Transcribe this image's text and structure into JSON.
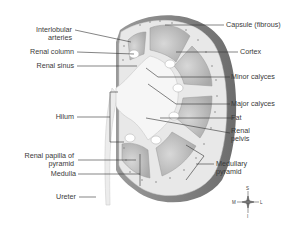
{
  "diagram": {
    "colors": {
      "capsule": "#7a7a7a",
      "cortex": "#e6e6e6",
      "pyramid": "#bdbdbd",
      "sinus": "#f4f4f4",
      "leader": "#333333",
      "text": "#3a3a3a"
    },
    "labels_left": [
      {
        "id": "interlobular-arteries",
        "lines": [
          "Interlobular",
          "arteries"
        ]
      },
      {
        "id": "renal-column",
        "lines": [
          "Renal column"
        ]
      },
      {
        "id": "renal-sinus",
        "lines": [
          "Renal sinus"
        ]
      },
      {
        "id": "hilum",
        "lines": [
          "Hilum"
        ]
      },
      {
        "id": "renal-papilla",
        "lines": [
          "Renal papilla of",
          "pyramid"
        ]
      },
      {
        "id": "medulla",
        "lines": [
          "Medulla"
        ]
      },
      {
        "id": "ureter",
        "lines": [
          "Ureter"
        ]
      }
    ],
    "labels_right": [
      {
        "id": "capsule",
        "lines": [
          "Capsule (fibrous)"
        ]
      },
      {
        "id": "cortex",
        "lines": [
          "Cortex"
        ]
      },
      {
        "id": "minor-calyces",
        "lines": [
          "Minor calyces"
        ]
      },
      {
        "id": "major-calyces",
        "lines": [
          "Major calyces"
        ]
      },
      {
        "id": "fat",
        "lines": [
          "Fat"
        ]
      },
      {
        "id": "renal-pelvis",
        "lines": [
          "Renal",
          "pelvis"
        ]
      },
      {
        "id": "medullary-pyramid",
        "lines": [
          "Medullary",
          "pyramid"
        ]
      }
    ],
    "compass": {
      "north": "S",
      "south": "I",
      "west": "M",
      "east": "L"
    }
  }
}
